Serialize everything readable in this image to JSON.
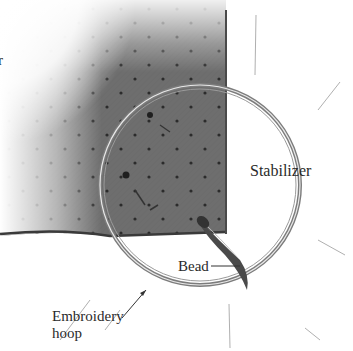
{
  "illustration": {
    "subject": "Bead embroidery in hoop",
    "colors": {
      "fabric": "#6e6e6e",
      "fabric_dark": "#5a5a5a",
      "dot": "#2b2b2b",
      "hoop": "#8a8a8a",
      "hoop_highlight": "#e8e8e8",
      "stabilizer": "#f4f4f4",
      "label_text": "#2a2a2a"
    }
  },
  "labels": {
    "partial_left": "r",
    "stabilizer": "Stabilizer",
    "bead": "Bead",
    "hoop_line1": "Embroidery",
    "hoop_line2": "hoop"
  }
}
